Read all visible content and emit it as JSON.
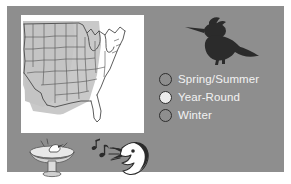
{
  "figure": {
    "type": "range-map-infographic",
    "background_color": "#8e8e8e",
    "outer_color": "#ffffff"
  },
  "map": {
    "name": "united-states-range-map",
    "region": "Continental United States",
    "land_color": "#ffffff",
    "shaded_color": "#c9c9c9",
    "outline_color": "#4a4a4a",
    "shaded_meaning": "Year-Round"
  },
  "bird_silhouette": {
    "name": "kingfisher-silhouette",
    "color": "#2b2b2b"
  },
  "legend": {
    "items": [
      {
        "label": "Spring/Summer",
        "swatch_fill": "#8e8e8e",
        "swatch_stroke": "#2e2e2e"
      },
      {
        "label": "Year-Round",
        "swatch_fill": "#ebebeb",
        "swatch_stroke": "#2e2e2e"
      },
      {
        "label": "Winter",
        "swatch_fill": "#8e8e8e",
        "swatch_stroke": "#2e2e2e"
      }
    ],
    "text_color": "#f2f2f2"
  },
  "illustrations": {
    "birdbath": {
      "name": "birdbath-with-bird"
    },
    "singing_bird": {
      "name": "singing-bird-head",
      "notes": "music-notes"
    }
  }
}
